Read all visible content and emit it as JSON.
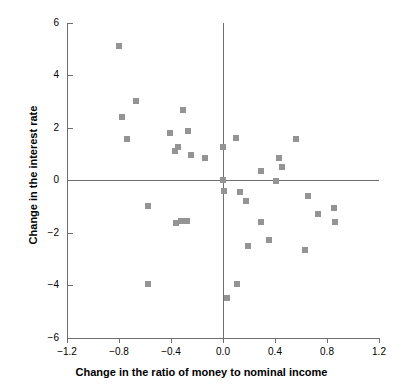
{
  "chart_data": {
    "type": "scatter",
    "title": "",
    "xlabel": "Change in the ratio of money to nominal income",
    "ylabel": "Change in the interest rate",
    "xlim": [
      -1.2,
      1.2
    ],
    "ylim": [
      -6,
      6
    ],
    "xticks": [
      -1.2,
      -0.8,
      -0.4,
      0.0,
      0.4,
      0.8,
      1.2
    ],
    "xtick_labels": [
      "−1.2",
      "−0.8",
      "−0.4",
      "0.0",
      "0.4",
      "0.8",
      "1.2"
    ],
    "yticks": [
      6,
      4,
      2,
      0,
      -2,
      -4,
      -6
    ],
    "ytick_labels": [
      "6",
      "4",
      "2",
      "0",
      "−2",
      "−4",
      "−6"
    ],
    "grid": false,
    "legend": null,
    "marker_color": "#949494",
    "marker_shape": "square",
    "axis_color": "#6e6e6e",
    "zero_lines": {
      "horizontal_y": 0,
      "vertical_x": 0.0
    },
    "points": [
      {
        "x": -0.8,
        "y": 5.1
      },
      {
        "x": -0.67,
        "y": 3.0
      },
      {
        "x": -0.78,
        "y": 2.4
      },
      {
        "x": -0.31,
        "y": 2.65
      },
      {
        "x": -0.41,
        "y": 1.8
      },
      {
        "x": -0.27,
        "y": 1.85
      },
      {
        "x": -0.74,
        "y": 1.55
      },
      {
        "x": 0.1,
        "y": 1.6
      },
      {
        "x": 0.56,
        "y": 1.55
      },
      {
        "x": -0.35,
        "y": 1.25
      },
      {
        "x": -0.37,
        "y": 1.1
      },
      {
        "x": 0.0,
        "y": 1.25
      },
      {
        "x": -0.25,
        "y": 0.95
      },
      {
        "x": -0.14,
        "y": 0.85
      },
      {
        "x": 0.43,
        "y": 0.85
      },
      {
        "x": 0.45,
        "y": 0.5
      },
      {
        "x": 0.29,
        "y": 0.35
      },
      {
        "x": 0.41,
        "y": -0.05
      },
      {
        "x": 0.0,
        "y": 0.0
      },
      {
        "x": 0.01,
        "y": -0.4
      },
      {
        "x": 0.13,
        "y": -0.45
      },
      {
        "x": 0.65,
        "y": -0.6
      },
      {
        "x": 0.18,
        "y": -0.8
      },
      {
        "x": -0.58,
        "y": -1.0
      },
      {
        "x": 0.85,
        "y": -1.05
      },
      {
        "x": 0.73,
        "y": -1.3
      },
      {
        "x": -0.36,
        "y": -1.65
      },
      {
        "x": -0.32,
        "y": -1.55
      },
      {
        "x": -0.28,
        "y": -1.55
      },
      {
        "x": 0.29,
        "y": -1.6
      },
      {
        "x": 0.86,
        "y": -1.6
      },
      {
        "x": 0.35,
        "y": -2.3
      },
      {
        "x": 0.19,
        "y": -2.5
      },
      {
        "x": 0.63,
        "y": -2.65
      },
      {
        "x": -0.58,
        "y": -3.95
      },
      {
        "x": 0.11,
        "y": -3.95
      },
      {
        "x": 0.03,
        "y": -4.5
      }
    ]
  }
}
